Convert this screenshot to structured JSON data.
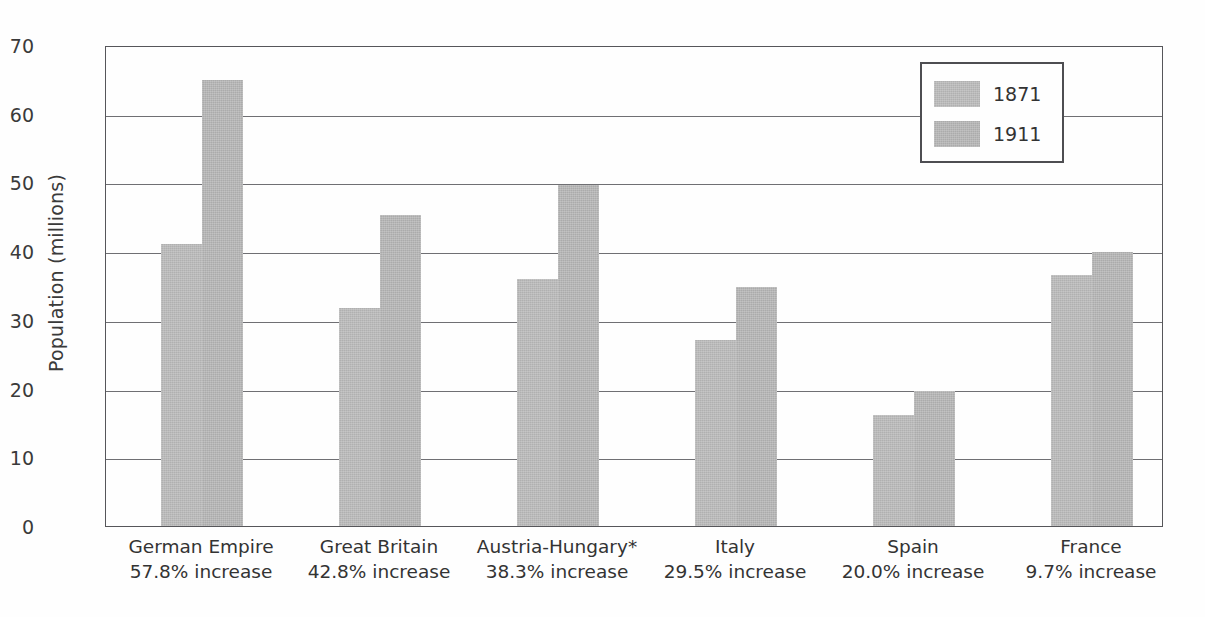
{
  "chart_data": {
    "type": "bar",
    "title": "",
    "xlabel": "",
    "ylabel": "Population (millions)",
    "ylim": [
      0,
      70
    ],
    "yticks": [
      0,
      10,
      20,
      30,
      40,
      50,
      60,
      70
    ],
    "ytick_labels": [
      "0",
      "10",
      "20",
      "30",
      "40",
      "50",
      "60",
      "70"
    ],
    "grid": true,
    "legend_position": "top-right",
    "categories": [
      "German Empire",
      "Great Britain",
      "Austria-Hungary*",
      "Italy",
      "Spain",
      "France"
    ],
    "category_sublabels": [
      "57.8% increase",
      "42.8% increase",
      "38.3% increase",
      "29.5% increase",
      "20.0% increase",
      "9.7% increase"
    ],
    "series": [
      {
        "name": "1871",
        "color": "#b0b0b0",
        "values": [
          41.1,
          31.7,
          36.0,
          27.1,
          16.2,
          36.5
        ]
      },
      {
        "name": "1911",
        "color": "#ababab",
        "values": [
          64.9,
          45.3,
          49.7,
          34.8,
          19.6,
          39.9
        ]
      }
    ]
  },
  "legend": {
    "entries": [
      {
        "label": "1871"
      },
      {
        "label": "1911"
      }
    ]
  },
  "axis": {
    "y_title": "Population (millions)"
  }
}
